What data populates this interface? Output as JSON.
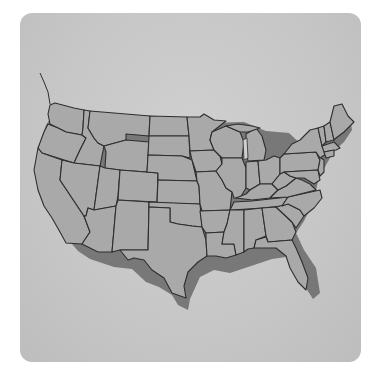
{
  "map": {
    "title": "",
    "region": "Contiguous United States",
    "style": "grayscale state outline map with drop shadow",
    "colors": {
      "page_background": "#ffffff",
      "card_background": "#c8c8c8",
      "state_fill": "#a9a9a9",
      "state_border": "#2e2e2e",
      "shadow": "#6a6a6a"
    },
    "labels": []
  }
}
